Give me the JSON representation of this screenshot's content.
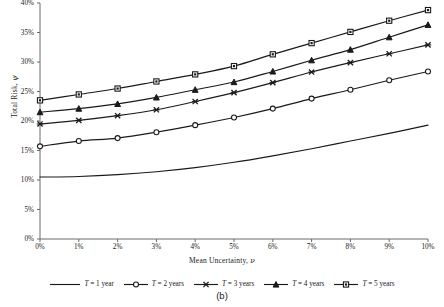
{
  "caption": "(b)",
  "axis": {
    "ylabel_text": "Total Risk, ",
    "ylabel_symbol": "ψ",
    "xlabel_text": "Mean Uncertainty, ",
    "xlabel_symbol": "ν"
  },
  "legend": {
    "items": [
      {
        "label_pre": "T",
        "label_post": " = 1 year",
        "marker": "none-icon"
      },
      {
        "label_pre": "T",
        "label_post": " = 2 years",
        "marker": "circle-marker-icon"
      },
      {
        "label_pre": "T",
        "label_post": " = 3 years",
        "marker": "cross-marker-icon"
      },
      {
        "label_pre": "T",
        "label_post": " = 4 years",
        "marker": "triangle-marker-icon"
      },
      {
        "label_pre": "T",
        "label_post": " = 5 years",
        "marker": "square-marker-icon"
      }
    ]
  },
  "chart_data": {
    "type": "line",
    "title": "",
    "subtitle": "",
    "xlabel": "Mean Uncertainty, ν",
    "ylabel": "Total Risk, ψ",
    "grid": false,
    "legend_position": "bottom",
    "xlim": [
      0,
      10
    ],
    "ylim": [
      0,
      40
    ],
    "xtick_labels": [
      "0%",
      "1%",
      "2%",
      "3%",
      "4%",
      "5%",
      "6%",
      "7%",
      "8%",
      "9%",
      "10%"
    ],
    "xtick_values": [
      0,
      1,
      2,
      3,
      4,
      5,
      6,
      7,
      8,
      9,
      10
    ],
    "ytick_labels": [
      "0%",
      "5%",
      "10%",
      "15%",
      "20%",
      "25%",
      "30%",
      "35%",
      "40%"
    ],
    "ytick_values": [
      0,
      5,
      10,
      15,
      20,
      25,
      30,
      35,
      40
    ],
    "x": [
      0,
      1,
      2,
      3,
      4,
      5,
      6,
      7,
      8,
      9,
      10
    ],
    "series": [
      {
        "name": "T = 1 year",
        "marker": "none",
        "values": [
          10.5,
          10.6,
          10.9,
          11.4,
          12.1,
          13.0,
          14.1,
          15.3,
          16.6,
          17.9,
          19.3
        ]
      },
      {
        "name": "T = 2 years",
        "marker": "circle",
        "values": [
          15.7,
          16.6,
          17.1,
          18.1,
          19.3,
          20.6,
          22.1,
          23.8,
          25.3,
          26.9,
          28.4
        ]
      },
      {
        "name": "T = 3 years",
        "marker": "cross",
        "values": [
          19.5,
          20.1,
          20.9,
          21.9,
          23.3,
          24.8,
          26.5,
          28.3,
          29.9,
          31.4,
          32.9
        ]
      },
      {
        "name": "T = 4 years",
        "marker": "triangle",
        "values": [
          21.5,
          22.1,
          22.9,
          24.0,
          25.3,
          26.6,
          28.4,
          30.3,
          32.1,
          34.2,
          36.3
        ]
      },
      {
        "name": "T = 5 years",
        "marker": "square",
        "values": [
          23.5,
          24.5,
          25.5,
          26.7,
          27.9,
          29.3,
          31.3,
          33.2,
          35.1,
          37.0,
          38.8
        ]
      }
    ]
  }
}
